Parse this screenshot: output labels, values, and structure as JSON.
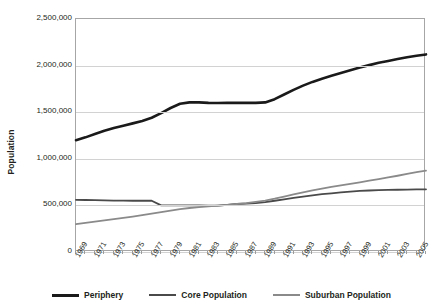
{
  "chart_data": {
    "type": "line",
    "title": "",
    "xlabel": "",
    "ylabel": "Population",
    "ylim": [
      0,
      2500000
    ],
    "xlim": [
      1969,
      2006
    ],
    "grid": true,
    "legend_position": "bottom",
    "ytick_labels": [
      "2,500,000",
      "2,000,000",
      "1,500,000",
      "1,000,000",
      "500,000",
      "0"
    ],
    "ytick_values": [
      2500000,
      2000000,
      1500000,
      1000000,
      500000,
      0
    ],
    "xtick_labels": [
      "1969",
      "1971",
      "1973",
      "1975",
      "1977",
      "1979",
      "1981",
      "1983",
      "1985",
      "1987",
      "1989",
      "1991",
      "1993",
      "1995",
      "1997",
      "1999",
      "2001",
      "2003",
      "2005"
    ],
    "x": [
      1969,
      1970,
      1971,
      1972,
      1973,
      1974,
      1975,
      1976,
      1977,
      1978,
      1979,
      1980,
      1981,
      1982,
      1983,
      1984,
      1985,
      1986,
      1987,
      1988,
      1989,
      1990,
      1991,
      1992,
      1993,
      1994,
      1995,
      1996,
      1997,
      1998,
      1999,
      2000,
      2001,
      2002,
      2003,
      2004,
      2005,
      2006
    ],
    "series": [
      {
        "name": "Periphery",
        "color": "#1a1a1a",
        "values": [
          1200000,
          1230000,
          1265000,
          1300000,
          1330000,
          1355000,
          1380000,
          1405000,
          1440000,
          1490000,
          1545000,
          1590000,
          1605000,
          1605000,
          1600000,
          1598000,
          1600000,
          1600000,
          1600000,
          1600000,
          1605000,
          1640000,
          1690000,
          1740000,
          1785000,
          1825000,
          1860000,
          1890000,
          1920000,
          1950000,
          1980000,
          2005000,
          2030000,
          2050000,
          2070000,
          2090000,
          2105000,
          2120000
        ]
      },
      {
        "name": "Core Population",
        "color": "#4a4a4a",
        "values": [
          560000,
          558000,
          556000,
          554000,
          552000,
          551000,
          550000,
          550000,
          550000,
          500000,
          500000,
          500000,
          500000,
          500000,
          498000,
          498000,
          505000,
          515000,
          520000,
          525000,
          535000,
          550000,
          565000,
          580000,
          595000,
          608000,
          620000,
          630000,
          640000,
          648000,
          655000,
          660000,
          663000,
          666000,
          668000,
          670000,
          672000,
          672000
        ]
      },
      {
        "name": "Suburban Population",
        "color": "#8a8a8a",
        "values": [
          300000,
          313000,
          326000,
          339000,
          352000,
          366000,
          380000,
          396000,
          412000,
          428000,
          444000,
          460000,
          472000,
          482000,
          490000,
          498000,
          506000,
          515000,
          525000,
          538000,
          552000,
          572000,
          595000,
          618000,
          640000,
          660000,
          680000,
          698000,
          715000,
          732000,
          748000,
          765000,
          782000,
          800000,
          818000,
          838000,
          858000,
          872000
        ]
      }
    ]
  },
  "legend": {
    "items": [
      {
        "label": "Periphery",
        "color": "#1a1a1a"
      },
      {
        "label": "Core Population",
        "color": "#4a4a4a"
      },
      {
        "label": "Suburban Population",
        "color": "#8a8a8a"
      }
    ]
  }
}
